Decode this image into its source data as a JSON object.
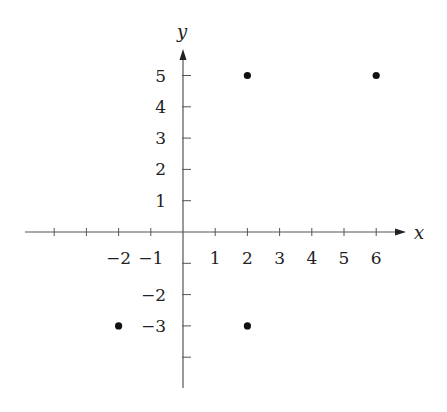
{
  "chart_data": {
    "type": "scatter",
    "title": "",
    "xlabel": "x",
    "ylabel": "y",
    "x_ticks": [
      -4,
      -3,
      -2,
      -1,
      1,
      2,
      3,
      4,
      5,
      6
    ],
    "x_tick_labels": [
      {
        "value": -2,
        "text": "−2"
      },
      {
        "value": -1,
        "text": "−1"
      },
      {
        "value": 1,
        "text": "1"
      },
      {
        "value": 2,
        "text": "2"
      },
      {
        "value": 3,
        "text": "3"
      },
      {
        "value": 4,
        "text": "4"
      },
      {
        "value": 5,
        "text": "5"
      },
      {
        "value": 6,
        "text": "6"
      }
    ],
    "y_ticks": [
      -4,
      -3,
      -2,
      -1,
      1,
      2,
      3,
      4,
      5
    ],
    "y_tick_labels": [
      {
        "value": 5,
        "text": "5"
      },
      {
        "value": 4,
        "text": "4"
      },
      {
        "value": 3,
        "text": "3"
      },
      {
        "value": 2,
        "text": "2"
      },
      {
        "value": 1,
        "text": "1"
      },
      {
        "value": -2,
        "text": "−2"
      },
      {
        "value": -3,
        "text": "−3"
      }
    ],
    "points": [
      {
        "x": 2,
        "y": 5
      },
      {
        "x": 6,
        "y": 5
      },
      {
        "x": -2,
        "y": -3
      },
      {
        "x": 2,
        "y": -3
      }
    ],
    "xlim": [
      -4.9,
      6.9
    ],
    "ylim": [
      -4.9,
      5.9
    ],
    "grid": false,
    "legend": null,
    "colors": {
      "axis": "#555555",
      "point": "#111111",
      "text": "#222222"
    }
  }
}
